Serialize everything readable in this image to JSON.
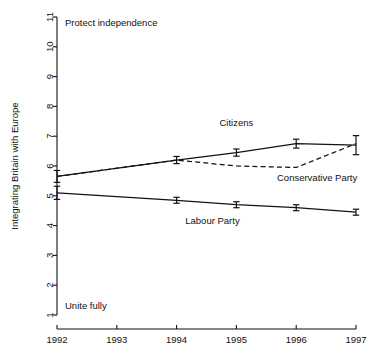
{
  "chart_data": {
    "type": "line",
    "title": "",
    "xlabel": "",
    "ylabel": "Integrating Britain with Europe",
    "x": [
      1992,
      1994,
      1995,
      1996,
      1997
    ],
    "xticklabels": [
      "1992",
      "1993",
      "1994",
      "1995",
      "1996",
      "1997"
    ],
    "xlim": [
      1992,
      1997
    ],
    "ylim": [
      1,
      11
    ],
    "yticklabels": [
      "1",
      "2",
      "3",
      "4",
      "5",
      "6",
      "7",
      "8",
      "9",
      "10",
      "11"
    ],
    "grid": false,
    "legend_position": "inline-annotations",
    "scale_top_label": "Protect independence",
    "scale_bottom_label": "Unite fully",
    "series": [
      {
        "name": "Citizens",
        "style": "solid",
        "x": [
          1992,
          1994,
          1995,
          1996,
          1997
        ],
        "values": [
          5.65,
          6.2,
          6.45,
          6.75,
          6.7
        ],
        "errorbars": [
          0.2,
          0.12,
          0.12,
          0.15,
          0.32
        ],
        "label_x": 1995.0,
        "label_y": 7.35
      },
      {
        "name": "Conservative Party",
        "style": "dashed",
        "x": [
          1992,
          1994,
          1995,
          1996,
          1997
        ],
        "values": [
          5.65,
          6.2,
          6.0,
          5.95,
          6.75
        ],
        "errorbars": [
          0.0,
          0.0,
          0.0,
          0.0,
          0.0
        ],
        "label_x": 1996.35,
        "label_y": 5.5
      },
      {
        "name": "Labour Party",
        "style": "solid",
        "x": [
          1992,
          1994,
          1995,
          1996,
          1997
        ],
        "values": [
          5.1,
          4.85,
          4.7,
          4.6,
          4.45
        ],
        "errorbars": [
          0.22,
          0.1,
          0.1,
          0.1,
          0.1
        ],
        "label_x": 1994.6,
        "label_y": 4.05
      }
    ]
  },
  "axes": {
    "y_axis_title": "Integrating Britain with Europe",
    "y_ticks": [
      "11",
      "10",
      "9",
      "8",
      "7",
      "6",
      "5",
      "4",
      "3",
      "2",
      "1"
    ],
    "x_ticks": [
      "1992",
      "1993",
      "1994",
      "1995",
      "1996",
      "1997"
    ]
  },
  "annotations": {
    "top": "Protect independence",
    "bottom": "Unite fully"
  },
  "series_labels": {
    "citizens": "Citizens",
    "conservative": "Conservative Party",
    "labour": "Labour Party"
  },
  "colors": {
    "ink": "#111111",
    "background": "#ffffff"
  }
}
